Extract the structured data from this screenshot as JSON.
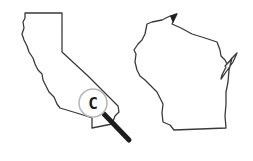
{
  "illustration": {
    "left_state": {
      "name": "california-outline"
    },
    "right_state": {
      "name": "wisconsin-outline"
    },
    "magnifier": {
      "letter": "C"
    }
  },
  "colors": {
    "background": "#ffffff",
    "outline": "#3a3a3a",
    "lens_ring": "#b8b8b8",
    "handle": "#1e1e1e"
  }
}
